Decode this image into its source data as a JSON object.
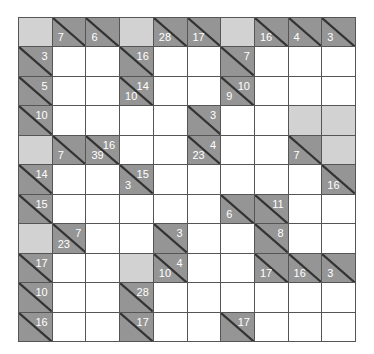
{
  "puzzle": {
    "type": "kakuro",
    "cols": 10,
    "rows": 11,
    "colors": {
      "clue_bg": "#959595",
      "blank_bg": "#d2d2d2",
      "entry_bg": "#ffffff",
      "grid_line": "#555555",
      "clue_text": "#ffffff"
    },
    "grid": [
      [
        {
          "t": "blank"
        },
        {
          "t": "clue",
          "down": "7"
        },
        {
          "t": "clue",
          "down": "6"
        },
        {
          "t": "blank"
        },
        {
          "t": "clue",
          "down": "28"
        },
        {
          "t": "clue",
          "down": "17"
        },
        {
          "t": "blank"
        },
        {
          "t": "clue",
          "down": "16"
        },
        {
          "t": "clue",
          "down": "4"
        },
        {
          "t": "clue",
          "down": "3"
        }
      ],
      [
        {
          "t": "clue",
          "across": "3"
        },
        {
          "t": "entry"
        },
        {
          "t": "entry"
        },
        {
          "t": "clue",
          "across": "16"
        },
        {
          "t": "entry"
        },
        {
          "t": "entry"
        },
        {
          "t": "clue",
          "across": "7"
        },
        {
          "t": "entry"
        },
        {
          "t": "entry"
        },
        {
          "t": "entry"
        }
      ],
      [
        {
          "t": "clue",
          "across": "5"
        },
        {
          "t": "entry"
        },
        {
          "t": "entry"
        },
        {
          "t": "clue",
          "across": "14",
          "down": "10"
        },
        {
          "t": "entry"
        },
        {
          "t": "entry"
        },
        {
          "t": "clue",
          "across": "10",
          "down": "9"
        },
        {
          "t": "entry"
        },
        {
          "t": "entry"
        },
        {
          "t": "entry"
        }
      ],
      [
        {
          "t": "clue",
          "across": "10"
        },
        {
          "t": "entry"
        },
        {
          "t": "entry"
        },
        {
          "t": "entry"
        },
        {
          "t": "entry"
        },
        {
          "t": "clue",
          "across": "3"
        },
        {
          "t": "entry"
        },
        {
          "t": "entry"
        },
        {
          "t": "blank"
        },
        {
          "t": "blank"
        }
      ],
      [
        {
          "t": "blank"
        },
        {
          "t": "clue",
          "down": "7"
        },
        {
          "t": "clue",
          "across": "16",
          "down": "39"
        },
        {
          "t": "entry"
        },
        {
          "t": "entry"
        },
        {
          "t": "clue",
          "across": "4",
          "down": "23"
        },
        {
          "t": "entry"
        },
        {
          "t": "entry"
        },
        {
          "t": "clue",
          "down": "7"
        },
        {
          "t": "blank"
        }
      ],
      [
        {
          "t": "clue",
          "across": "14"
        },
        {
          "t": "entry"
        },
        {
          "t": "entry"
        },
        {
          "t": "clue",
          "across": "15",
          "down": "3"
        },
        {
          "t": "entry"
        },
        {
          "t": "entry"
        },
        {
          "t": "entry"
        },
        {
          "t": "entry"
        },
        {
          "t": "entry"
        },
        {
          "t": "clue",
          "down": "16"
        }
      ],
      [
        {
          "t": "clue",
          "across": "15"
        },
        {
          "t": "entry"
        },
        {
          "t": "entry"
        },
        {
          "t": "entry"
        },
        {
          "t": "entry"
        },
        {
          "t": "entry"
        },
        {
          "t": "clue",
          "down": "6"
        },
        {
          "t": "clue",
          "across": "11"
        },
        {
          "t": "entry"
        },
        {
          "t": "entry"
        }
      ],
      [
        {
          "t": "blank"
        },
        {
          "t": "clue",
          "across": "7",
          "down": "23"
        },
        {
          "t": "entry"
        },
        {
          "t": "entry"
        },
        {
          "t": "clue",
          "across": "3"
        },
        {
          "t": "entry"
        },
        {
          "t": "entry"
        },
        {
          "t": "clue",
          "across": "8"
        },
        {
          "t": "entry"
        },
        {
          "t": "entry"
        }
      ],
      [
        {
          "t": "clue",
          "across": "17"
        },
        {
          "t": "entry"
        },
        {
          "t": "entry"
        },
        {
          "t": "blank"
        },
        {
          "t": "clue",
          "across": "4",
          "down": "10"
        },
        {
          "t": "entry"
        },
        {
          "t": "entry"
        },
        {
          "t": "clue",
          "down": "17"
        },
        {
          "t": "clue",
          "down": "16"
        },
        {
          "t": "clue",
          "down": "3"
        }
      ],
      [
        {
          "t": "clue",
          "across": "10"
        },
        {
          "t": "entry"
        },
        {
          "t": "entry"
        },
        {
          "t": "clue",
          "across": "28"
        },
        {
          "t": "entry"
        },
        {
          "t": "entry"
        },
        {
          "t": "entry"
        },
        {
          "t": "entry"
        },
        {
          "t": "entry"
        },
        {
          "t": "entry"
        }
      ],
      [
        {
          "t": "clue",
          "across": "16"
        },
        {
          "t": "entry"
        },
        {
          "t": "entry"
        },
        {
          "t": "clue",
          "across": "17"
        },
        {
          "t": "entry"
        },
        {
          "t": "entry"
        },
        {
          "t": "clue",
          "across": "17"
        },
        {
          "t": "entry"
        },
        {
          "t": "entry"
        },
        {
          "t": "entry"
        }
      ]
    ]
  }
}
